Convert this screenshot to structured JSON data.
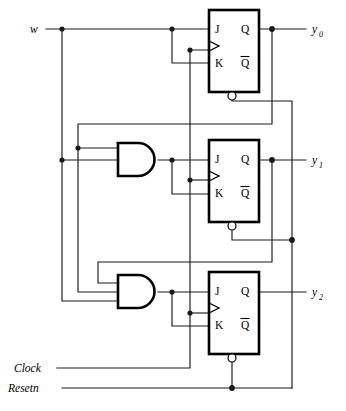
{
  "diagram": {
    "type": "digital-logic-circuit",
    "inputs": [
      {
        "name": "w-input",
        "label": "w",
        "x": 30,
        "y": 32
      },
      {
        "name": "clock-input",
        "label": "Clock",
        "x": 14,
        "y": 372
      },
      {
        "name": "resetn-input",
        "label": "Resetn",
        "x": 8,
        "y": 392
      }
    ],
    "outputs": [
      {
        "name": "y0-output",
        "base": "y",
        "sub": "0",
        "x": 312,
        "y": 33
      },
      {
        "name": "y1-output",
        "base": "y",
        "sub": "1",
        "x": 312,
        "y": 170
      },
      {
        "name": "y2-output",
        "base": "y",
        "sub": "2",
        "x": 312,
        "y": 299
      }
    ],
    "flipflops": [
      {
        "name": "flipflop-0",
        "j": "J",
        "k": "K",
        "q": "Q",
        "qbar": "Q"
      },
      {
        "name": "flipflop-1",
        "j": "J",
        "k": "K",
        "q": "Q",
        "qbar": "Q"
      },
      {
        "name": "flipflop-2",
        "j": "J",
        "k": "K",
        "q": "Q",
        "qbar": "Q"
      }
    ],
    "gates": [
      {
        "name": "and-gate-1",
        "kind": "AND",
        "inputs": 2
      },
      {
        "name": "and-gate-2",
        "kind": "AND",
        "inputs": 3
      }
    ],
    "colors": {
      "wire": "#1a1a1a",
      "outline": "#000000",
      "fill": "#ffffff"
    }
  }
}
